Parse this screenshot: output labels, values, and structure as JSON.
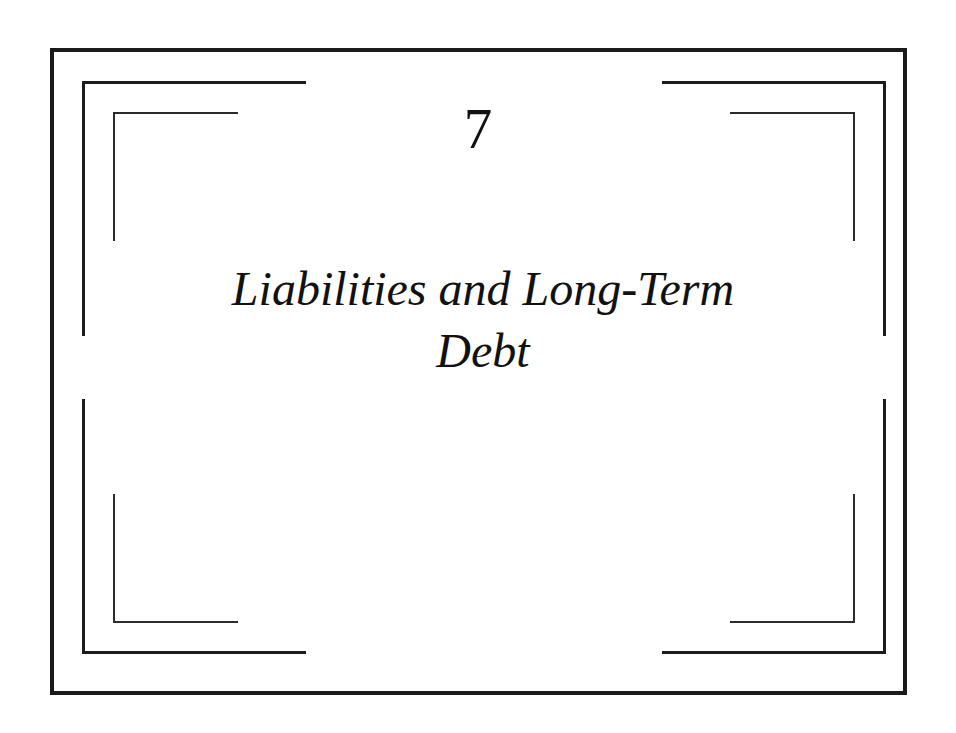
{
  "page": {
    "background_color": "#ffffff",
    "ink_color": "#1a1a1a"
  },
  "frame": {
    "outer_border_label": "outer-frame",
    "corner_brackets": [
      {
        "position": "top-left",
        "ring": 2
      },
      {
        "position": "top-right",
        "ring": 2
      },
      {
        "position": "bottom-left",
        "ring": 2
      },
      {
        "position": "bottom-right",
        "ring": 2
      },
      {
        "position": "top-left",
        "ring": 3
      },
      {
        "position": "top-right",
        "ring": 3
      },
      {
        "position": "bottom-left",
        "ring": 3
      },
      {
        "position": "bottom-right",
        "ring": 3
      }
    ]
  },
  "chapter": {
    "number": "7",
    "title_lines": [
      "Liabilities and Long-Term",
      "Debt"
    ],
    "title_full": "Liabilities and Long-Term Debt"
  }
}
